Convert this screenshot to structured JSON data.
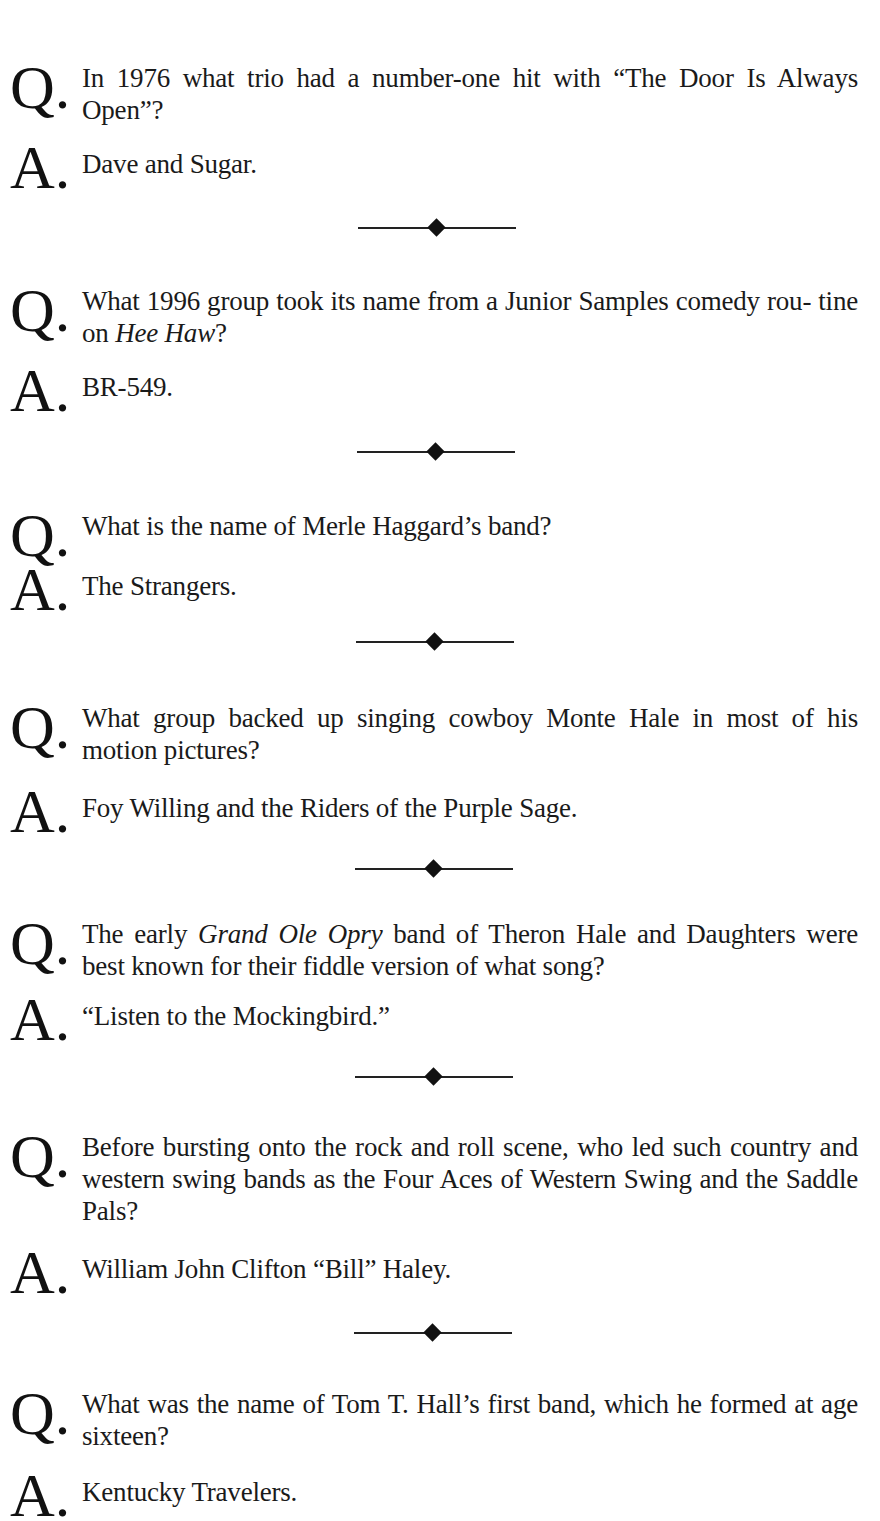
{
  "qa": [
    {
      "q_letter": "Q.",
      "a_letter": "A.",
      "question_parts": [
        "In 1976 what trio had a number-one hit with “The Door Is Always Open”?"
      ],
      "answer": "Dave and Sugar."
    },
    {
      "q_letter": "Q.",
      "a_letter": "A.",
      "question_parts": [
        "What 1996 group took its name from a Junior Samples comedy rou- tine on ",
        "Hee Haw",
        "?"
      ],
      "answer": "BR-549."
    },
    {
      "q_letter": "Q.",
      "a_letter": "A.",
      "question_parts": [
        "What is the name of Merle Haggard’s band?"
      ],
      "answer": "The Strangers."
    },
    {
      "q_letter": "Q.",
      "a_letter": "A.",
      "question_parts": [
        "What group backed up singing cowboy Monte Hale in most of his motion pictures?"
      ],
      "answer": "Foy Willing and the Riders of the Purple Sage."
    },
    {
      "q_letter": "Q.",
      "a_letter": "A.",
      "question_parts": [
        "The early ",
        "Grand Ole Opry",
        " band of Theron Hale and Daughters were best known for their fiddle version of what song?"
      ],
      "answer": "“Listen to the Mockingbird.”"
    },
    {
      "q_letter": "Q.",
      "a_letter": "A.",
      "question_parts": [
        "Before bursting onto the rock and roll scene, who led such country and western swing bands as the Four Aces of Western Swing and the Saddle Pals?"
      ],
      "answer": "William John Clifton “Bill” Haley."
    },
    {
      "q_letter": "Q.",
      "a_letter": "A.",
      "question_parts": [
        "What was the name of Tom T. Hall’s first band, which he formed at age sixteen?"
      ],
      "answer": "Kentucky Travelers."
    }
  ],
  "divider_icon": "diamond-ornament-icon"
}
